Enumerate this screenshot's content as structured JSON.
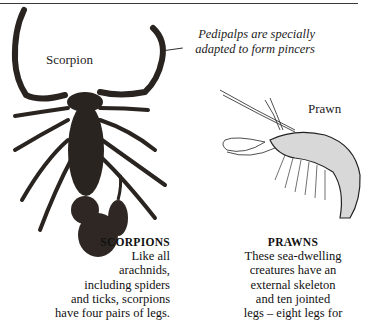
{
  "labels": {
    "scorpion": "Scorpion",
    "prawn": "Prawn"
  },
  "callout": {
    "line1": "Pedipalps are specially",
    "line2": "adapted to form pincers"
  },
  "captions": {
    "scorpions": {
      "heading": "SCORPIONS",
      "lines": [
        "Like all",
        "arachnids,",
        "including spiders",
        "and ticks, scorpions",
        "have four pairs of legs."
      ]
    },
    "prawns": {
      "heading": "PRAWNS",
      "lines": [
        "These sea-dwelling",
        "creatures have an",
        "external skeleton",
        "and ten jointed",
        "legs – eight legs for"
      ]
    }
  },
  "colors": {
    "background": "#ffffff",
    "scorpion_body": "#2a2420",
    "text": "#1a1a1a"
  }
}
